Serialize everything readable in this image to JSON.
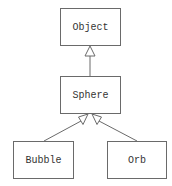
{
  "diagram": {
    "type": "uml-class-inheritance",
    "classes": [
      {
        "id": "object",
        "name": "Object"
      },
      {
        "id": "sphere",
        "name": "Sphere"
      },
      {
        "id": "bubble",
        "name": "Bubble"
      },
      {
        "id": "orb",
        "name": "Orb"
      }
    ],
    "relations": [
      {
        "from": "Sphere",
        "to": "Object",
        "kind": "generalization"
      },
      {
        "from": "Bubble",
        "to": "Sphere",
        "kind": "generalization"
      },
      {
        "from": "Orb",
        "to": "Sphere",
        "kind": "generalization"
      }
    ],
    "colors": {
      "line": "#6a6a6a",
      "text": "#333333",
      "background": "#ffffff"
    }
  }
}
